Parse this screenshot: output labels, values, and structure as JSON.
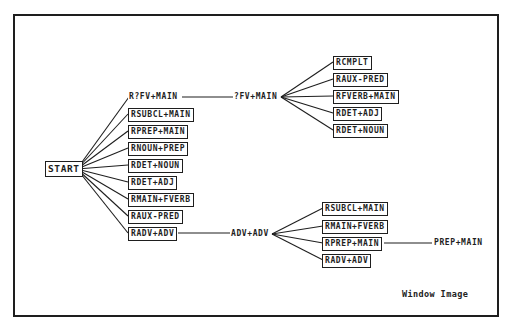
{
  "diagram": {
    "type": "parse-tree",
    "root": {
      "label": "START",
      "children": [
        {
          "label": "R?FV+MAIN",
          "boxed": false,
          "next": {
            "label": "?FV+MAIN",
            "children": [
              {
                "label": "RCMPLT"
              },
              {
                "label": "RAUX-PRED"
              },
              {
                "label": "RFVERB+MAIN"
              },
              {
                "label": "RDET+ADJ"
              },
              {
                "label": "RDET+NOUN"
              }
            ]
          }
        },
        {
          "label": "RSUBCL+MAIN",
          "boxed": true
        },
        {
          "label": "RPREP+MAIN",
          "boxed": true
        },
        {
          "label": "RNOUN+PREP",
          "boxed": true
        },
        {
          "label": "RDET+NOUN",
          "boxed": true
        },
        {
          "label": "RDET+ADJ",
          "boxed": true
        },
        {
          "label": "RMAIN+FVERB",
          "boxed": true
        },
        {
          "label": "RAUX-PRED",
          "boxed": true
        },
        {
          "label": "RADV+ADV",
          "boxed": true,
          "next": {
            "label": "ADV+ADV",
            "children": [
              {
                "label": "RSUBCL+MAIN"
              },
              {
                "label": "RMAIN+FVERB"
              },
              {
                "label": "RPREP+MAIN",
                "next": {
                  "label": "PREP+MAIN"
                }
              },
              {
                "label": "RADV+ADV"
              }
            ]
          }
        }
      ]
    }
  },
  "labels": {
    "start": "START",
    "left": [
      "R?FV+MAIN",
      "RSUBCL+MAIN",
      "RPREP+MAIN",
      "RNOUN+PREP",
      "RDET+NOUN",
      "RDET+ADJ",
      "RMAIN+FVERB",
      "RAUX-PRED",
      "RADV+ADV"
    ],
    "fv_main": "?FV+MAIN",
    "fv_children": [
      "RCMPLT",
      "RAUX-PRED",
      "RFVERB+MAIN",
      "RDET+ADJ",
      "RDET+NOUN"
    ],
    "adv_adv": "ADV+ADV",
    "adv_children": [
      "RSUBCL+MAIN",
      "RMAIN+FVERB",
      "RPREP+MAIN",
      "RADV+ADV"
    ],
    "prep_main": "PREP+MAIN"
  },
  "caption": "Window Image",
  "colors": {
    "line": "#1e1e1e",
    "background": "#ffffff"
  }
}
